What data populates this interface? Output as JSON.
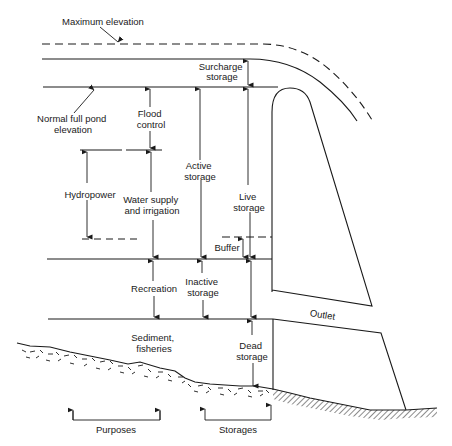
{
  "labels": {
    "maximum_elevation": "Maximum elevation",
    "surcharge_storage": [
      "Surcharge",
      "storage"
    ],
    "normal_full_pond": [
      "Normal full pond",
      "elevation"
    ],
    "flood_control": [
      "Flood",
      "control"
    ],
    "hydropower": "Hydropower",
    "water_supply": [
      "Water supply",
      "and irrigation"
    ],
    "active_storage": [
      "Active",
      "storage"
    ],
    "live_storage": [
      "Live",
      "storage"
    ],
    "buffer": "Buffer",
    "recreation": "Recreation",
    "inactive_storage": [
      "Inactive",
      "storage"
    ],
    "outlet": "Outlet",
    "sediment_fisheries": [
      "Sediment,",
      "fisheries"
    ],
    "dead_storage": [
      "Dead",
      "storage"
    ],
    "purposes": "Purposes",
    "storages": "Storages"
  },
  "colors": {
    "ink": "#1a1a1a",
    "background": "#ffffff"
  }
}
